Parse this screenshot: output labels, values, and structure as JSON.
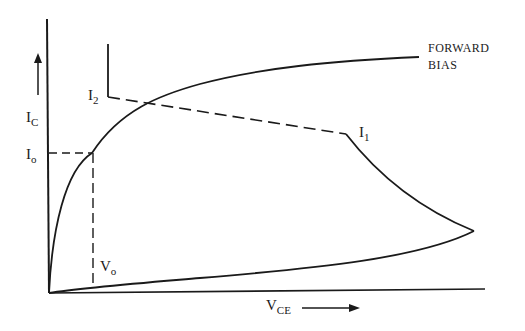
{
  "diagram": {
    "type": "transistor collector characteristic (I_C vs V_CE) with load/switching trajectory",
    "axes": {
      "y_label": "I",
      "y_label_sub": "C",
      "x_label": "V",
      "x_label_sub": "CE",
      "y_arrow": "up-arrow",
      "x_arrow": "right-arrow"
    },
    "labels": {
      "i2": "I",
      "i2_sub": "2",
      "i1": "I",
      "i1_sub": "1",
      "io": "I",
      "io_sub": "o",
      "vo": "V",
      "vo_sub": "o",
      "forward_line1": "FORWARD",
      "forward_line2": "BIAS"
    },
    "curves": [
      {
        "name": "forward-bias-curve",
        "style": "solid"
      },
      {
        "name": "load-line-i2-i1",
        "style": "dashed"
      },
      {
        "name": "i2-vertical-stub",
        "style": "solid"
      },
      {
        "name": "i1-turnoff-curve",
        "style": "solid"
      },
      {
        "name": "reverse-return-curve",
        "style": "solid"
      },
      {
        "name": "io-projection",
        "style": "dashed"
      },
      {
        "name": "vo-projection",
        "style": "dashed"
      }
    ],
    "colors": {
      "ink": "#1a1a1a",
      "background": "#ffffff"
    }
  }
}
